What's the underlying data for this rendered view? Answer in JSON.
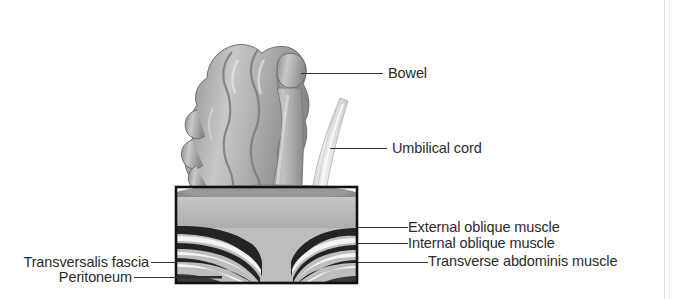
{
  "figure": {
    "kind": "medical-illustration",
    "background_color": "#ffffff",
    "line_color": "#333333",
    "text_color": "#2b2b2b"
  },
  "labels": {
    "bowel": "Bowel",
    "umbilical_cord": "Umbilical cord",
    "external_oblique": "External oblique muscle",
    "internal_oblique": "Internal oblique muscle",
    "transverse_abdominis": "Transverse abdominis muscle",
    "transversalis_fascia": "Transversalis fascia",
    "peritoneum": "Peritoneum"
  },
  "illustration": {
    "wall_block": {
      "left": 175,
      "top": 186,
      "right": 358,
      "bottom": 283,
      "border_color": "#111111"
    },
    "layer_colors": {
      "skin_fat": "#b9b9b9",
      "top_surface": "#8f8f8f",
      "muscle_dark": "#2a2a2a",
      "fascia_light": "#f2f2f2",
      "bowel_gray": "#a6a6a6",
      "cord_pale": "#dcdcdc"
    }
  }
}
